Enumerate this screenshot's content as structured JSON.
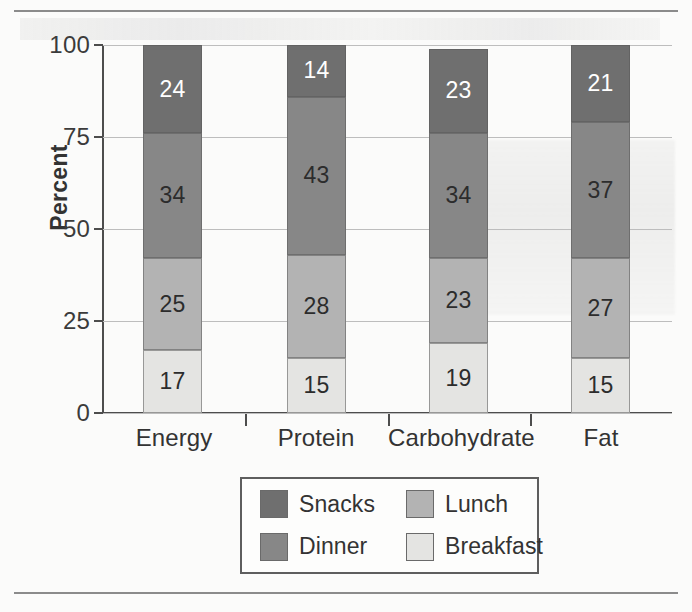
{
  "chart_data": {
    "type": "bar",
    "subtype": "stacked-bar-100-percent",
    "title": "",
    "xlabel": "",
    "ylabel": "Percent",
    "ylim": [
      0,
      100
    ],
    "yticks": [
      0,
      25,
      50,
      75,
      100
    ],
    "ytick_labels": [
      "0",
      "25",
      "50",
      "75",
      "100"
    ],
    "grid": true,
    "grid_axis": "y",
    "legend_position": "bottom-center",
    "stack_order_bottom_to_top": [
      "Breakfast",
      "Lunch",
      "Dinner",
      "Snacks"
    ],
    "categories": [
      "Energy",
      "Protein",
      "Carbohydrate",
      "Fat"
    ],
    "series": [
      {
        "name": "Snacks",
        "color": "#6f6f6f",
        "label_color": "#ffffff",
        "values": [
          24,
          14,
          23,
          21
        ]
      },
      {
        "name": "Dinner",
        "color": "#878787",
        "label_color": "#2c2c2c",
        "values": [
          34,
          43,
          34,
          37
        ]
      },
      {
        "name": "Lunch",
        "color": "#b3b3b3",
        "label_color": "#2c2c2c",
        "values": [
          25,
          28,
          23,
          27
        ]
      },
      {
        "name": "Breakfast",
        "color": "#e4e4e2",
        "label_color": "#2c2c2c",
        "values": [
          17,
          15,
          19,
          15
        ]
      }
    ],
    "data_labels": {
      "Energy": {
        "Snacks": "24",
        "Dinner": "34",
        "Lunch": "25",
        "Breakfast": "17"
      },
      "Protein": {
        "Snacks": "14",
        "Dinner": "43",
        "Lunch": "28",
        "Breakfast": "15"
      },
      "Carbohydrate": {
        "Snacks": "23",
        "Dinner": "34",
        "Lunch": "23",
        "Breakfast": "19"
      },
      "Fat": {
        "Snacks": "21",
        "Dinner": "37",
        "Lunch": "27",
        "Breakfast": "15"
      }
    }
  },
  "axes": {
    "y_label": "Percent",
    "y_ticks": [
      {
        "value": 100,
        "label": "100"
      },
      {
        "value": 75,
        "label": "75"
      },
      {
        "value": 50,
        "label": "50"
      },
      {
        "value": 25,
        "label": "25"
      },
      {
        "value": 0,
        "label": "0"
      }
    ],
    "x_categories": [
      {
        "label": "Energy"
      },
      {
        "label": "Protein"
      },
      {
        "label": "Carbohydrate"
      },
      {
        "label": "Fat"
      }
    ]
  },
  "legend": {
    "items": [
      {
        "label": "Snacks",
        "color": "#6f6f6f"
      },
      {
        "label": "Lunch",
        "color": "#b3b3b3"
      },
      {
        "label": "Dinner",
        "color": "#878787"
      },
      {
        "label": "Breakfast",
        "color": "#e4e4e2"
      }
    ]
  },
  "colors": {
    "snacks": "#6f6f6f",
    "dinner": "#878787",
    "lunch": "#b3b3b3",
    "breakfast": "#e4e4e2",
    "axis": "#4d4d4d",
    "grid": "#bdbdbd",
    "text": "#333333",
    "page_rule": "#8b8b8b"
  }
}
